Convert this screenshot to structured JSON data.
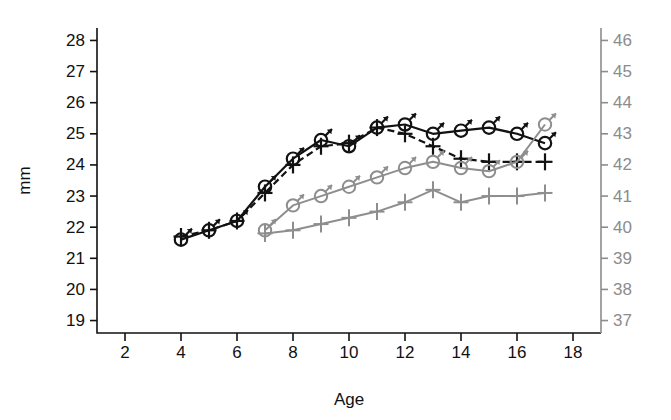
{
  "chart_data": {
    "type": "line",
    "title": "",
    "subtitle": "",
    "xlabel": "Age",
    "ylabel": "mm",
    "y2label": "",
    "xlim": [
      1,
      19
    ],
    "ylim": [
      18.6,
      28.4
    ],
    "y2lim": [
      36.6,
      46.4
    ],
    "xticks": [
      2,
      4,
      6,
      8,
      10,
      12,
      14,
      16,
      18
    ],
    "xtick_labels": [
      "2",
      "4",
      "6",
      "8",
      "10",
      "12",
      "14",
      "16",
      "18"
    ],
    "yticks": [
      19,
      20,
      21,
      22,
      23,
      24,
      25,
      26,
      27,
      28
    ],
    "ytick_labels": [
      "19",
      "20",
      "21",
      "22",
      "23",
      "24",
      "25",
      "26",
      "27",
      "28"
    ],
    "y2ticks": [
      37,
      38,
      39,
      40,
      41,
      42,
      43,
      44,
      45,
      46
    ],
    "y2tick_labels": [
      "37",
      "38",
      "39",
      "40",
      "41",
      "42",
      "43",
      "44",
      "45",
      "46"
    ],
    "grid": false,
    "legend": "none",
    "axis_colors": {
      "left_axis": "#111111",
      "right_axis": "#8c8c8c",
      "dark_series": "#121212",
      "gray_series": "#8e8e8e"
    },
    "series": [
      {
        "name": "dark-male-solid",
        "color": "#121212",
        "linestyle": "solid",
        "marker": "male-symbol",
        "axis": "left",
        "x": [
          4,
          5,
          6,
          7,
          8,
          9,
          10,
          11,
          12,
          13,
          14,
          15,
          16,
          17
        ],
        "values": [
          21.6,
          21.9,
          22.2,
          23.3,
          24.2,
          24.8,
          24.6,
          25.2,
          25.3,
          25.0,
          25.1,
          25.2,
          25.0,
          24.7
        ]
      },
      {
        "name": "dark-cross-dashed",
        "color": "#121212",
        "linestyle": "dashed",
        "marker": "cross",
        "axis": "left",
        "x": [
          4,
          5,
          6,
          7,
          8,
          9,
          10,
          11,
          12,
          13,
          14,
          15,
          16,
          17
        ],
        "values": [
          21.7,
          21.9,
          22.2,
          23.1,
          24.0,
          24.6,
          24.7,
          25.2,
          25.0,
          24.6,
          24.2,
          24.1,
          24.1,
          24.1
        ]
      },
      {
        "name": "gray-male-solid",
        "color": "#8e8e8e",
        "linestyle": "solid",
        "marker": "male-symbol",
        "axis": "right",
        "x": [
          7,
          8,
          9,
          10,
          11,
          12,
          13,
          14,
          15,
          16,
          17
        ],
        "values": [
          39.9,
          40.7,
          41.0,
          41.3,
          41.6,
          41.9,
          42.1,
          41.9,
          41.8,
          42.1,
          43.3
        ]
      },
      {
        "name": "gray-cross-solid",
        "color": "#8e8e8e",
        "linestyle": "solid",
        "marker": "cross",
        "axis": "right",
        "x": [
          7,
          8,
          9,
          10,
          11,
          12,
          13,
          14,
          15,
          16,
          17
        ],
        "values": [
          39.8,
          39.9,
          40.1,
          40.3,
          40.5,
          40.8,
          41.2,
          40.8,
          41.0,
          41.0,
          41.1
        ]
      }
    ],
    "annotations": []
  }
}
